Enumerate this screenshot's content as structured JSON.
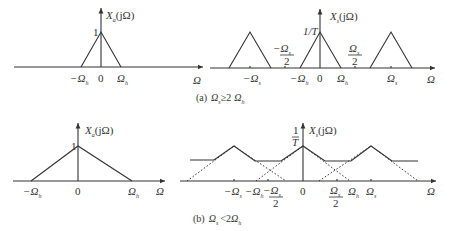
{
  "figure": {
    "panel_a": {
      "caption": "(a)  Ωₛ ≥ 2 Ωₕ",
      "caption_prefix": "(a)",
      "caption_condition": "Ωs ≥ 2 Ωh",
      "original": {
        "title": "Xa(jΩ)",
        "peak_label": "1",
        "ticks": [
          "-Ωh",
          "0",
          "Ωh"
        ],
        "axis_label": "Ω"
      },
      "sampled": {
        "title": "Xs(jΩ)",
        "peak_label": "1/T",
        "ticks": [
          "-Ωs",
          "-Ωs/2",
          "-Ωh",
          "0",
          "Ωh",
          "Ωs/2",
          "Ωs"
        ],
        "axis_label": "Ω"
      }
    },
    "panel_b": {
      "caption_prefix": "(b)",
      "caption_condition": "Ωs < 2 Ωh",
      "original": {
        "title": "Xa(jΩ)",
        "peak_label": "1",
        "ticks": [
          "-Ωh",
          "0",
          "Ωh"
        ],
        "axis_label": "Ω"
      },
      "sampled": {
        "title": "Xs(jΩ)",
        "peak_label": "1/T",
        "ticks": [
          "-Ωs",
          "-Ωh",
          "-Ωs/2",
          "0",
          "Ωs/2",
          "Ωh",
          "Ωs"
        ],
        "axis_label": "Ω"
      }
    }
  },
  "labels": {
    "omega": "Ω",
    "zero": "0",
    "one": "1",
    "one_over_T_num": "1",
    "one_over_T_den": "T",
    "one_over_T": "1/T",
    "two": "2",
    "minus": "−",
    "X": "X",
    "a": "a",
    "s": "s",
    "h": "h",
    "jOmega": "(jΩ)",
    "cap_a": "(a)",
    "cap_b": "(b)",
    "geq": "≥",
    "lt": "<",
    "two_plain": "2"
  }
}
